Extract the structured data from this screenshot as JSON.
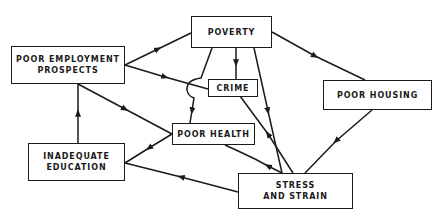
{
  "diagram": {
    "nodes": {
      "poverty": {
        "lines": [
          "POVERTY"
        ]
      },
      "employment": {
        "lines": [
          "POOR EMPLOYMENT",
          "PROSPECTS"
        ]
      },
      "crime": {
        "lines": [
          "CRIME"
        ]
      },
      "housing": {
        "lines": [
          "POOR HOUSING"
        ]
      },
      "health": {
        "lines": [
          "POOR HEALTH"
        ]
      },
      "education": {
        "lines": [
          "INADEQUATE",
          "EDUCATION"
        ]
      },
      "stress": {
        "lines": [
          "STRESS",
          "AND STRAIN"
        ]
      }
    },
    "edges": [
      {
        "from": "POOR EMPLOYMENT PROSPECTS",
        "to": "POVERTY"
      },
      {
        "from": "POOR EMPLOYMENT PROSPECTS",
        "to": "CRIME"
      },
      {
        "from": "POOR EMPLOYMENT PROSPECTS",
        "to": "POOR HEALTH"
      },
      {
        "from": "INADEQUATE EDUCATION",
        "to": "POOR EMPLOYMENT PROSPECTS"
      },
      {
        "from": "POOR HEALTH",
        "to": "INADEQUATE EDUCATION"
      },
      {
        "from": "STRESS AND STRAIN",
        "to": "INADEQUATE EDUCATION"
      },
      {
        "from": "POVERTY",
        "to": "CRIME"
      },
      {
        "from": "POVERTY",
        "to": "POOR HEALTH"
      },
      {
        "from": "POVERTY",
        "to": "POOR HOUSING"
      },
      {
        "from": "POVERTY",
        "to": "STRESS AND STRAIN"
      },
      {
        "from": "STRESS AND STRAIN",
        "to": "CRIME"
      },
      {
        "from": "STRESS AND STRAIN",
        "to": "POOR HEALTH"
      },
      {
        "from": "POOR HOUSING",
        "to": "STRESS AND STRAIN"
      }
    ],
    "line_color": "#1a1a1a"
  }
}
